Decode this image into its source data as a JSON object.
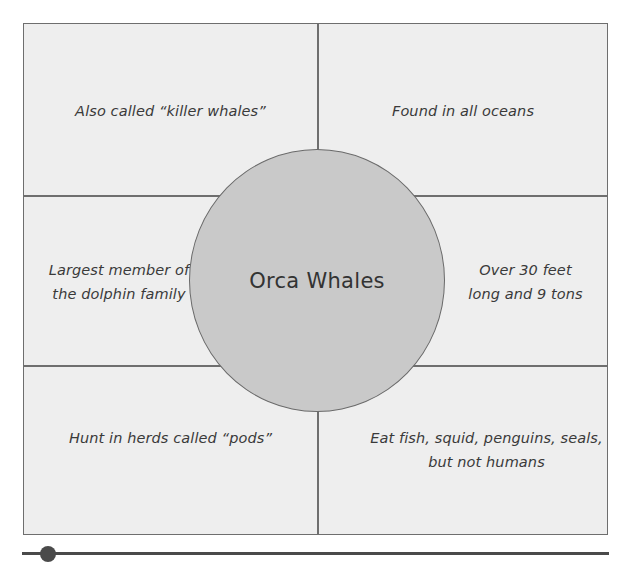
{
  "diagram": {
    "type": "concept-map",
    "center": {
      "title": "Orca Whales"
    },
    "cells": {
      "top_left": "Also called “killer whales”",
      "top_right": "Found in all oceans",
      "middle_left": [
        "Largest member of",
        "the dolphin family"
      ],
      "middle_right": [
        "Over 30 feet",
        "long and 9 tons"
      ],
      "bottom_left": "Hunt in herds called “pods”",
      "bottom_right": [
        "Eat fish, squid, penguins, seals,",
        "but not humans"
      ]
    },
    "colors": {
      "cell_background": "#eeeeee",
      "circle_fill": "#c9c9c9",
      "border": "#6e6e6e",
      "text": "#3a3a3a"
    }
  }
}
